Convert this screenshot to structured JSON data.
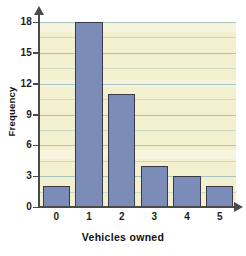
{
  "chart_data": {
    "type": "bar",
    "title": "",
    "subtitle": "",
    "xlabel": "Vehicles owned",
    "ylabel": "Frequency",
    "categories": [
      "0",
      "1",
      "2",
      "3",
      "4",
      "5"
    ],
    "values": [
      2,
      18,
      11,
      4,
      3,
      2
    ],
    "series": [
      {
        "name": "Frequency",
        "values": [
          2,
          18,
          11,
          4,
          3,
          2
        ]
      }
    ],
    "ylim": [
      0,
      18
    ],
    "xlim": [
      0,
      5
    ],
    "y_ticks": [
      0,
      3,
      6,
      9,
      12,
      15,
      18
    ],
    "y_tick_labels": [
      "0",
      "3",
      "6",
      "9",
      "12",
      "15",
      "18"
    ],
    "x_tick_labels": [
      "0",
      "1",
      "2",
      "3",
      "4",
      "5"
    ],
    "grid": true,
    "grid_axis": "y",
    "grid_interval": 3,
    "legend": false,
    "legend_position": "none",
    "annotations": [],
    "colors": {
      "bar_fill": "#7b8cb8",
      "bar_border": "#3a3a44",
      "plot_background": "#f2f0ce",
      "page_background": "#ffffff",
      "gridline": "#9dbdb8",
      "axis": "#4a4a4a",
      "text": "#1d1d1d"
    }
  }
}
